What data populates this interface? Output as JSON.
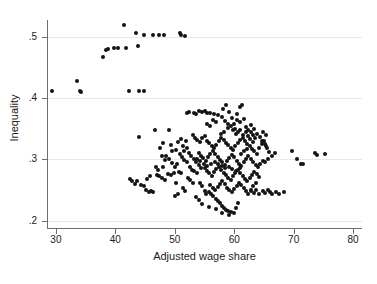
{
  "chart_data": {
    "type": "scatter",
    "title": "",
    "xlabel": "Adjusted wage share",
    "ylabel": "Inequality",
    "xlim": [
      28.5,
      81.5
    ],
    "ylim": [
      0.188,
      0.527
    ],
    "xticks": [
      30,
      40,
      50,
      60,
      70,
      80
    ],
    "xtick_labels": [
      "30",
      "40",
      "50",
      "60",
      "70",
      "80"
    ],
    "yticks": [
      0.2,
      0.3,
      0.4,
      0.5
    ],
    "ytick_labels": [
      ".2",
      ".3",
      ".4",
      ".5"
    ],
    "grid": "horizontal",
    "legend": "none",
    "marker": "filled-circle",
    "marker_color": "#141414",
    "grid_color": "#e8e8e8",
    "axis_color": "#6e6e6e",
    "background": "#ffffff",
    "n_points": 302,
    "points": [
      [
        29.4,
        0.412
      ],
      [
        33.6,
        0.428
      ],
      [
        34.1,
        0.411
      ],
      [
        34.3,
        0.41
      ],
      [
        38.0,
        0.467
      ],
      [
        38.5,
        0.478
      ],
      [
        38.8,
        0.479
      ],
      [
        39.8,
        0.481
      ],
      [
        40.4,
        0.481
      ],
      [
        41.4,
        0.519
      ],
      [
        41.8,
        0.481
      ],
      [
        42.3,
        0.412
      ],
      [
        43.5,
        0.505
      ],
      [
        43.8,
        0.484
      ],
      [
        44.0,
        0.412
      ],
      [
        44.8,
        0.412
      ],
      [
        44.9,
        0.502
      ],
      [
        46.4,
        0.503
      ],
      [
        47.3,
        0.503
      ],
      [
        48.2,
        0.503
      ],
      [
        50.9,
        0.505
      ],
      [
        51.0,
        0.503
      ],
      [
        51.8,
        0.501
      ],
      [
        43.9,
        0.336
      ],
      [
        46.6,
        0.348
      ],
      [
        47.5,
        0.318
      ],
      [
        47.8,
        0.306
      ],
      [
        48.0,
        0.326
      ],
      [
        48.4,
        0.299
      ],
      [
        49.0,
        0.348
      ],
      [
        49.3,
        0.323
      ],
      [
        49.6,
        0.313
      ],
      [
        50.2,
        0.315
      ],
      [
        50.6,
        0.328
      ],
      [
        51.0,
        0.333
      ],
      [
        51.4,
        0.322
      ],
      [
        51.9,
        0.33
      ],
      [
        52.0,
        0.376
      ],
      [
        52.4,
        0.377
      ],
      [
        53.2,
        0.376
      ],
      [
        53.6,
        0.374
      ],
      [
        54.1,
        0.378
      ],
      [
        54.5,
        0.377
      ],
      [
        55.0,
        0.378
      ],
      [
        55.4,
        0.375
      ],
      [
        56.0,
        0.376
      ],
      [
        56.6,
        0.374
      ],
      [
        57.3,
        0.372
      ],
      [
        57.9,
        0.369
      ],
      [
        58.1,
        0.382
      ],
      [
        58.6,
        0.389
      ],
      [
        59.1,
        0.377
      ],
      [
        59.6,
        0.368
      ],
      [
        60.0,
        0.358
      ],
      [
        60.4,
        0.373
      ],
      [
        60.9,
        0.385
      ],
      [
        61.3,
        0.389
      ],
      [
        61.7,
        0.366
      ],
      [
        62.0,
        0.352
      ],
      [
        62.4,
        0.347
      ],
      [
        62.8,
        0.344
      ],
      [
        63.2,
        0.34
      ],
      [
        61.0,
        0.347
      ],
      [
        60.6,
        0.344
      ],
      [
        60.1,
        0.35
      ],
      [
        59.5,
        0.355
      ],
      [
        58.9,
        0.351
      ],
      [
        42.4,
        0.268
      ],
      [
        42.8,
        0.264
      ],
      [
        43.3,
        0.26
      ],
      [
        43.7,
        0.265
      ],
      [
        44.3,
        0.258
      ],
      [
        44.8,
        0.256
      ],
      [
        45.2,
        0.25
      ],
      [
        45.6,
        0.247
      ],
      [
        46.0,
        0.249
      ],
      [
        46.4,
        0.247
      ],
      [
        47.0,
        0.275
      ],
      [
        47.4,
        0.272
      ],
      [
        47.9,
        0.27
      ],
      [
        48.3,
        0.266
      ],
      [
        48.9,
        0.276
      ],
      [
        49.4,
        0.274
      ],
      [
        49.8,
        0.277
      ],
      [
        50.2,
        0.262
      ],
      [
        50.7,
        0.279
      ],
      [
        51.1,
        0.277
      ],
      [
        51.6,
        0.299
      ],
      [
        52.0,
        0.296
      ],
      [
        52.5,
        0.288
      ],
      [
        52.9,
        0.283
      ],
      [
        53.3,
        0.281
      ],
      [
        53.8,
        0.277
      ],
      [
        54.2,
        0.262
      ],
      [
        54.6,
        0.257
      ],
      [
        55.0,
        0.248
      ],
      [
        55.3,
        0.244
      ],
      [
        55.7,
        0.246
      ],
      [
        56.1,
        0.243
      ],
      [
        56.5,
        0.24
      ],
      [
        56.9,
        0.236
      ],
      [
        57.3,
        0.232
      ],
      [
        57.6,
        0.229
      ],
      [
        58.0,
        0.224
      ],
      [
        58.3,
        0.22
      ],
      [
        58.7,
        0.218
      ],
      [
        59.0,
        0.216
      ],
      [
        59.4,
        0.214
      ],
      [
        59.9,
        0.213
      ],
      [
        60.3,
        0.221
      ],
      [
        60.7,
        0.229
      ],
      [
        53.0,
        0.34
      ],
      [
        53.4,
        0.335
      ],
      [
        53.8,
        0.331
      ],
      [
        54.2,
        0.328
      ],
      [
        54.6,
        0.334
      ],
      [
        55.0,
        0.338
      ],
      [
        55.4,
        0.33
      ],
      [
        55.8,
        0.326
      ],
      [
        56.2,
        0.322
      ],
      [
        56.6,
        0.318
      ],
      [
        57.0,
        0.324
      ],
      [
        57.4,
        0.33
      ],
      [
        57.8,
        0.335
      ],
      [
        58.2,
        0.331
      ],
      [
        58.6,
        0.327
      ],
      [
        59.0,
        0.323
      ],
      [
        59.4,
        0.319
      ],
      [
        59.8,
        0.315
      ],
      [
        60.2,
        0.321
      ],
      [
        60.6,
        0.327
      ],
      [
        61.0,
        0.331
      ],
      [
        61.4,
        0.335
      ],
      [
        61.8,
        0.329
      ],
      [
        62.2,
        0.325
      ],
      [
        62.6,
        0.321
      ],
      [
        63.0,
        0.317
      ],
      [
        63.4,
        0.313
      ],
      [
        63.8,
        0.309
      ],
      [
        64.2,
        0.318
      ],
      [
        64.6,
        0.325
      ],
      [
        65.0,
        0.33
      ],
      [
        65.4,
        0.322
      ],
      [
        54.0,
        0.31
      ],
      [
        54.4,
        0.306
      ],
      [
        54.8,
        0.302
      ],
      [
        55.2,
        0.298
      ],
      [
        55.6,
        0.304
      ],
      [
        56.0,
        0.309
      ],
      [
        56.4,
        0.313
      ],
      [
        56.8,
        0.308
      ],
      [
        57.2,
        0.303
      ],
      [
        57.6,
        0.299
      ],
      [
        58.0,
        0.295
      ],
      [
        58.4,
        0.291
      ],
      [
        58.8,
        0.297
      ],
      [
        59.2,
        0.302
      ],
      [
        59.6,
        0.307
      ],
      [
        60.0,
        0.303
      ],
      [
        60.4,
        0.298
      ],
      [
        60.8,
        0.293
      ],
      [
        61.2,
        0.289
      ],
      [
        61.6,
        0.295
      ],
      [
        62.0,
        0.3
      ],
      [
        62.4,
        0.305
      ],
      [
        62.8,
        0.301
      ],
      [
        63.2,
        0.296
      ],
      [
        63.6,
        0.291
      ],
      [
        64.0,
        0.287
      ],
      [
        64.4,
        0.293
      ],
      [
        64.8,
        0.298
      ],
      [
        55.0,
        0.285
      ],
      [
        55.4,
        0.281
      ],
      [
        55.8,
        0.277
      ],
      [
        56.2,
        0.273
      ],
      [
        56.6,
        0.279
      ],
      [
        57.0,
        0.284
      ],
      [
        57.4,
        0.288
      ],
      [
        57.8,
        0.283
      ],
      [
        58.2,
        0.278
      ],
      [
        58.6,
        0.274
      ],
      [
        59.0,
        0.27
      ],
      [
        59.4,
        0.266
      ],
      [
        59.8,
        0.272
      ],
      [
        60.2,
        0.277
      ],
      [
        60.6,
        0.282
      ],
      [
        61.0,
        0.278
      ],
      [
        61.4,
        0.273
      ],
      [
        61.8,
        0.268
      ],
      [
        62.2,
        0.264
      ],
      [
        62.6,
        0.27
      ],
      [
        63.0,
        0.275
      ],
      [
        63.4,
        0.28
      ],
      [
        63.8,
        0.276
      ],
      [
        64.2,
        0.271
      ],
      [
        56.0,
        0.258
      ],
      [
        56.4,
        0.254
      ],
      [
        56.8,
        0.25
      ],
      [
        57.2,
        0.255
      ],
      [
        57.6,
        0.26
      ],
      [
        58.0,
        0.264
      ],
      [
        58.4,
        0.259
      ],
      [
        58.8,
        0.254
      ],
      [
        59.2,
        0.25
      ],
      [
        59.6,
        0.246
      ],
      [
        60.0,
        0.252
      ],
      [
        60.4,
        0.257
      ],
      [
        60.8,
        0.262
      ],
      [
        61.2,
        0.258
      ],
      [
        61.6,
        0.253
      ],
      [
        62.0,
        0.248
      ],
      [
        62.4,
        0.244
      ],
      [
        62.8,
        0.25
      ],
      [
        63.2,
        0.256
      ],
      [
        63.6,
        0.261
      ],
      [
        50.8,
        0.309
      ],
      [
        51.2,
        0.304
      ],
      [
        51.6,
        0.313
      ],
      [
        52.0,
        0.318
      ],
      [
        52.4,
        0.31
      ],
      [
        52.8,
        0.305
      ],
      [
        53.2,
        0.3
      ],
      [
        53.6,
        0.295
      ],
      [
        54.0,
        0.29
      ],
      [
        54.4,
        0.286
      ],
      [
        50.4,
        0.292
      ],
      [
        50.0,
        0.288
      ],
      [
        49.5,
        0.294
      ],
      [
        49.1,
        0.3
      ],
      [
        48.6,
        0.305
      ],
      [
        48.1,
        0.288
      ],
      [
        61.5,
        0.34
      ],
      [
        61.9,
        0.345
      ],
      [
        62.3,
        0.338
      ],
      [
        62.7,
        0.333
      ],
      [
        63.1,
        0.328
      ],
      [
        63.5,
        0.335
      ],
      [
        63.9,
        0.342
      ],
      [
        64.3,
        0.336
      ],
      [
        64.7,
        0.33
      ],
      [
        65.1,
        0.325
      ],
      [
        65.5,
        0.318
      ],
      [
        65.9,
        0.312
      ],
      [
        64.9,
        0.345
      ],
      [
        65.3,
        0.339
      ],
      [
        63.3,
        0.35
      ],
      [
        62.9,
        0.356
      ],
      [
        66.3,
        0.306
      ],
      [
        66.8,
        0.311
      ],
      [
        65.6,
        0.3
      ],
      [
        65.2,
        0.296
      ],
      [
        64.8,
        0.248
      ],
      [
        65.2,
        0.245
      ],
      [
        65.6,
        0.25
      ],
      [
        66.0,
        0.246
      ],
      [
        66.4,
        0.243
      ],
      [
        67.0,
        0.247
      ],
      [
        67.5,
        0.244
      ],
      [
        68.3,
        0.246
      ],
      [
        62.9,
        0.248
      ],
      [
        63.3,
        0.245
      ],
      [
        63.7,
        0.25
      ],
      [
        64.1,
        0.243
      ],
      [
        69.8,
        0.313
      ],
      [
        70.5,
        0.3
      ],
      [
        71.2,
        0.293
      ],
      [
        71.6,
        0.293
      ],
      [
        73.6,
        0.31
      ],
      [
        74.0,
        0.307
      ],
      [
        75.2,
        0.309
      ],
      [
        47.2,
        0.283
      ],
      [
        46.8,
        0.288
      ],
      [
        45.9,
        0.272
      ],
      [
        45.4,
        0.268
      ],
      [
        52.2,
        0.27
      ],
      [
        52.6,
        0.266
      ],
      [
        53.0,
        0.262
      ],
      [
        51.4,
        0.253
      ],
      [
        51.8,
        0.249
      ],
      [
        50.6,
        0.244
      ],
      [
        50.1,
        0.24
      ],
      [
        57.0,
        0.219
      ],
      [
        57.9,
        0.213
      ],
      [
        59.2,
        0.21
      ],
      [
        55.8,
        0.222
      ],
      [
        54.6,
        0.227
      ],
      [
        54.0,
        0.233
      ],
      [
        53.5,
        0.238
      ],
      [
        58.5,
        0.362
      ],
      [
        59.0,
        0.358
      ],
      [
        60.5,
        0.364
      ],
      [
        61.0,
        0.36
      ],
      [
        56.5,
        0.364
      ],
      [
        57.0,
        0.36
      ],
      [
        55.5,
        0.358
      ],
      [
        56.0,
        0.354
      ],
      [
        59.8,
        0.347
      ],
      [
        60.3,
        0.341
      ],
      [
        58.3,
        0.345
      ],
      [
        57.8,
        0.341
      ],
      [
        61.2,
        0.309
      ],
      [
        61.7,
        0.313
      ],
      [
        62.1,
        0.317
      ],
      [
        60.9,
        0.285
      ],
      [
        60.3,
        0.281
      ],
      [
        59.7,
        0.284
      ],
      [
        59.1,
        0.288
      ],
      [
        58.5,
        0.285
      ],
      [
        57.9,
        0.289
      ],
      [
        57.3,
        0.293
      ],
      [
        56.7,
        0.296
      ],
      [
        56.1,
        0.292
      ],
      [
        55.5,
        0.289
      ],
      [
        54.9,
        0.293
      ],
      [
        54.3,
        0.297
      ],
      [
        53.7,
        0.301
      ]
    ]
  }
}
